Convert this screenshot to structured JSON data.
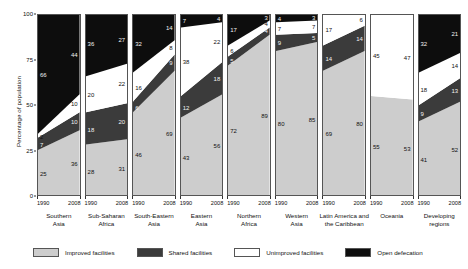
{
  "chart_data": {
    "type": "area",
    "title": "",
    "xlabel": "",
    "ylabel": "Percentage of population",
    "ylim": [
      0,
      100
    ],
    "yticks": [
      0,
      25,
      50,
      75,
      100
    ],
    "x": [
      "1990",
      "2008"
    ],
    "grid": false,
    "legend_position": "bottom",
    "series": [
      {
        "name": "Improved facilities",
        "color": "#cdcdcd"
      },
      {
        "name": "Shared facilities",
        "color": "#3b3b3b"
      },
      {
        "name": "Unimproved facilities",
        "color": "#ffffff"
      },
      {
        "name": "Open defecation",
        "color": "#0d0d0d"
      }
    ],
    "panels": [
      {
        "name": "Southern Asia",
        "title_lines": [
          "Southern",
          "Asia"
        ],
        "values_1990": {
          "improved": 25,
          "shared": 7,
          "unimproved": 2,
          "open": 66
        },
        "values_2008": {
          "improved": 36,
          "shared": 10,
          "unimproved": 10,
          "open": 44
        }
      },
      {
        "name": "Sub-Saharan Africa",
        "title_lines": [
          "Sub-Saharan",
          "Africa"
        ],
        "values_1990": {
          "improved": 28,
          "shared": 18,
          "unimproved": 20,
          "open": 36
        },
        "values_2008": {
          "improved": 31,
          "shared": 20,
          "unimproved": 22,
          "open": 27
        }
      },
      {
        "name": "South-Eastern Asia",
        "title_lines": [
          "South-Eastern",
          "Asia"
        ],
        "values_1990": {
          "improved": 46,
          "shared": 6,
          "unimproved": 16,
          "open": 32
        },
        "values_2008": {
          "improved": 69,
          "shared": 9,
          "unimproved": 8,
          "open": 14
        }
      },
      {
        "name": "Eastern Asia",
        "title_lines": [
          "Eastern",
          "Asia"
        ],
        "values_1990": {
          "improved": 43,
          "shared": 12,
          "unimproved": 38,
          "open": 7
        },
        "values_2008": {
          "improved": 56,
          "shared": 18,
          "unimproved": 22,
          "open": 4
        }
      },
      {
        "name": "Northern Africa",
        "title_lines": [
          "Northern",
          "Africa"
        ],
        "values_1990": {
          "improved": 72,
          "shared": 5,
          "unimproved": 6,
          "open": 17
        },
        "values_2008": {
          "improved": 89,
          "shared": 4,
          "unimproved": 4,
          "open": 3
        }
      },
      {
        "name": "Western Asia",
        "title_lines": [
          "Western",
          "Asia"
        ],
        "values_1990": {
          "improved": 80,
          "shared": 9,
          "unimproved": 7,
          "open": 4
        },
        "values_2008": {
          "improved": 85,
          "shared": 5,
          "unimproved": 7,
          "open": 3
        }
      },
      {
        "name": "Latin America and the Caribbean",
        "title_lines": [
          "Latin America and",
          "the Caribbean"
        ],
        "values_1990": {
          "improved": 69,
          "shared": 14,
          "unimproved": 17,
          "open": 0
        },
        "values_2008": {
          "improved": 80,
          "shared": 14,
          "unimproved": 6,
          "open": 0
        }
      },
      {
        "name": "Oceania",
        "title_lines": [
          "Oceania",
          ""
        ],
        "values_1990": {
          "improved": 55,
          "shared": 0,
          "unimproved": 45,
          "open": 0
        },
        "values_2008": {
          "improved": 53,
          "shared": 0,
          "unimproved": 47,
          "open": 0
        }
      },
      {
        "name": "Developing regions",
        "title_lines": [
          "Developing",
          "regions"
        ],
        "values_1990": {
          "improved": 41,
          "shared": 9,
          "unimproved": 18,
          "open": 32
        },
        "values_2008": {
          "improved": 52,
          "shared": 13,
          "unimproved": 14,
          "open": 21
        }
      }
    ]
  },
  "colors": {
    "improved": "#cdcdcd",
    "shared": "#3b3b3b",
    "unimproved": "#ffffff",
    "open": "#0d0d0d",
    "border": "#555555",
    "text": "#111111"
  }
}
